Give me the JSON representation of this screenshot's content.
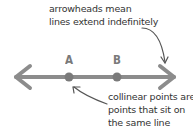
{
  "annotations": {
    "top_note": [
      "arrowheads mean",
      "lines extend indefinitely"
    ],
    "bottom_note": [
      "collinear points are",
      "points that sit on",
      "the same line"
    ]
  },
  "points": [
    {
      "label": "A"
    },
    {
      "label": "B"
    }
  ],
  "colors": {
    "line": "#8c8c8c",
    "point": "#7a7a7a",
    "annotation_arrow": "#555555",
    "text": "#333333"
  }
}
